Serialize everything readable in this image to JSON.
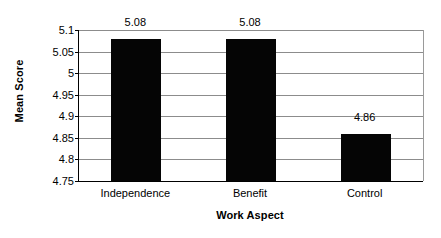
{
  "chart_data": {
    "type": "bar",
    "title": "",
    "xlabel": "Work Aspect",
    "ylabel": "Mean Score",
    "categories": [
      "Independence",
      "Benefit",
      "Control"
    ],
    "values": [
      5.08,
      5.08,
      4.86
    ],
    "data_labels": [
      "5.08",
      "5.08",
      "4.86"
    ],
    "ylim": [
      4.75,
      5.1
    ],
    "ytick_step": 0.05,
    "ytick_labels": [
      "5.1",
      "5.05",
      "5",
      "4.95",
      "4.9",
      "4.85",
      "4.8",
      "4.75"
    ],
    "ytick_values": [
      5.1,
      5.05,
      5,
      4.95,
      4.9,
      4.85,
      4.8,
      4.75
    ],
    "grid": true,
    "legend": null,
    "legend_position": "none",
    "bar_color": "#050505",
    "gridline_color": "#8c8c8c",
    "axis_color": "#000000",
    "background": "#ffffff"
  }
}
